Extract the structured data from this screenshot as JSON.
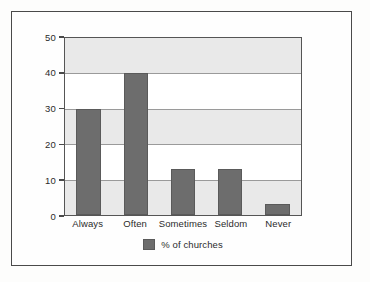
{
  "frame": {
    "border_color": "#4a4a4a"
  },
  "legend": {
    "label": "% of churches",
    "swatch_color": "#6d6d6d",
    "position": "bottom-center"
  },
  "axis": {
    "y_ticks": [
      "0",
      "10",
      "20",
      "30",
      "40",
      "50"
    ]
  },
  "chart_data": {
    "type": "bar",
    "title": "",
    "subtitle": "",
    "xlabel": "",
    "ylabel": "",
    "categories": [
      "Always",
      "Often",
      "Sometimes",
      "Seldom",
      "Never"
    ],
    "values": [
      30,
      40,
      13,
      13,
      3
    ],
    "series": [
      {
        "name": "% of churches",
        "values": [
          30,
          40,
          13,
          13,
          3
        ],
        "color": "#6d6d6d"
      }
    ],
    "ylim": [
      0,
      50
    ],
    "ytick_values": [
      0,
      10,
      20,
      30,
      40,
      50
    ],
    "ytick_labels": [
      "0",
      "10",
      "20",
      "30",
      "40",
      "50"
    ],
    "grid": true,
    "grid_color": "#9a9a9a",
    "banded_background": true,
    "band_color": "#e9e9e9",
    "plot_background": "#ffffff",
    "legend": [
      "% of churches"
    ],
    "legend_position": "bottom-center",
    "annotations": []
  }
}
